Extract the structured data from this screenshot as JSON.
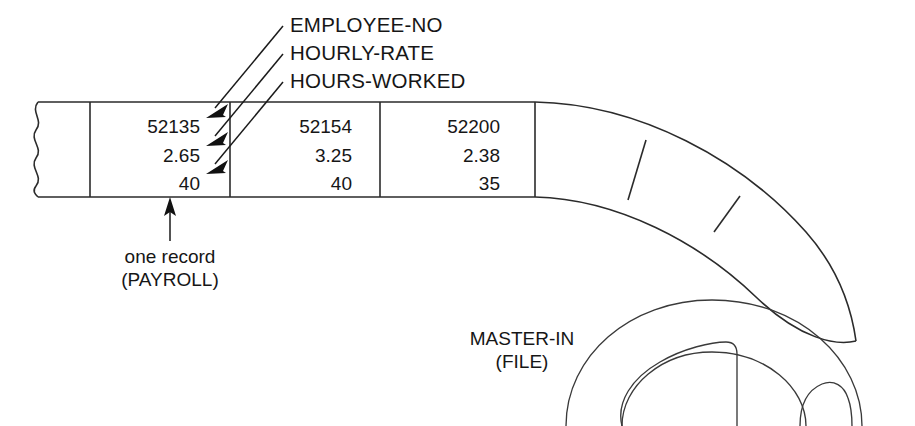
{
  "figure": {
    "kind": "magnetic-tape-record-layout-diagram",
    "field_labels": [
      "EMPLOYEE-NO",
      "HOURLY-RATE",
      "HOURS-WORKED"
    ],
    "records": [
      {
        "employee_no": "52135",
        "hourly_rate": "2.65",
        "hours_worked": "40"
      },
      {
        "employee_no": "52154",
        "hourly_rate": "3.25",
        "hours_worked": "40"
      },
      {
        "employee_no": "52200",
        "hourly_rate": "2.38",
        "hours_worked": "35"
      }
    ],
    "record_caption": {
      "line1": "one record",
      "line2": "(PAYROLL)"
    },
    "file_caption": {
      "line1": "MASTER-IN",
      "line2": "(FILE)"
    },
    "colors": {
      "ink": "#1a1a1a",
      "line": "#2b2b2b",
      "background": "#ffffff"
    }
  }
}
